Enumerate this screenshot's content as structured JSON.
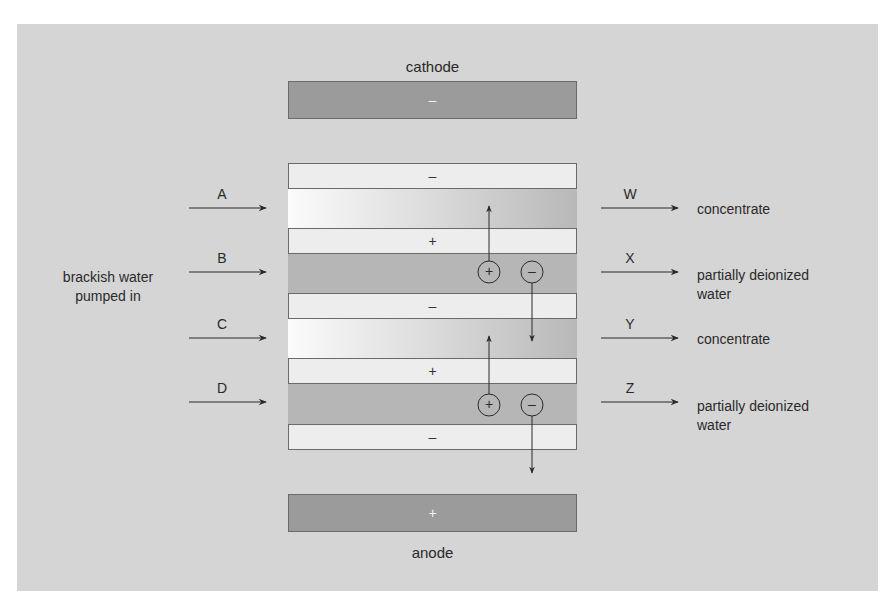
{
  "diagram": {
    "electrodes": {
      "cathode": {
        "label": "cathode",
        "symbol": "–"
      },
      "anode": {
        "label": "anode",
        "symbol": "+"
      }
    },
    "membranes": [
      {
        "symbol": "–"
      },
      {
        "symbol": "+"
      },
      {
        "symbol": "–"
      },
      {
        "symbol": "+"
      },
      {
        "symbol": "–"
      }
    ],
    "inputs": {
      "source_label_line1": "brackish water",
      "source_label_line2": "pumped in",
      "streams": [
        "A",
        "B",
        "C",
        "D"
      ]
    },
    "outputs": [
      {
        "letter": "W",
        "label_line1": "concentrate",
        "label_line2": ""
      },
      {
        "letter": "X",
        "label_line1": "partially deionized",
        "label_line2": "water"
      },
      {
        "letter": "Y",
        "label_line1": "concentrate",
        "label_line2": ""
      },
      {
        "letter": "Z",
        "label_line1": "partially deionized",
        "label_line2": "water"
      }
    ],
    "ions": {
      "cation_symbol": "+",
      "anion_symbol": "–"
    },
    "colors": {
      "background": "#d5d5d5",
      "electrode": "#9b9b9b",
      "membrane": "#ededed",
      "dilute_channel": "#b6b6b6",
      "concentrate_gradient_start": "#fbfbfb",
      "concentrate_gradient_end": "#b8b8b8",
      "line": "#333333"
    }
  }
}
